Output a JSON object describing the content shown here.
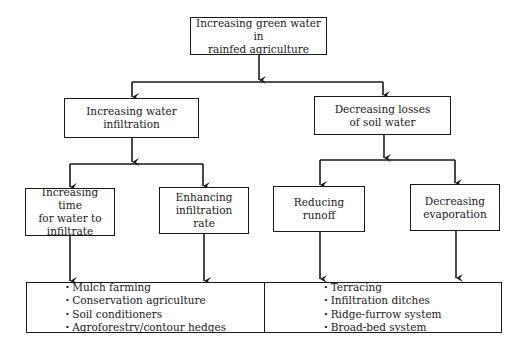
{
  "diagram": {
    "root": {
      "label_lines": [
        "Increasing green water in",
        "rainfed agriculture"
      ]
    },
    "level2": [
      {
        "label_lines": [
          "Increasing water",
          "infiltration"
        ]
      },
      {
        "label_lines": [
          "Decreasing losses",
          "of soil water"
        ]
      }
    ],
    "level3": [
      {
        "label_lines": [
          "Increasing time",
          "for water to",
          "infiltrate"
        ]
      },
      {
        "label_lines": [
          "Enhancing",
          "infiltration rate"
        ]
      },
      {
        "label_lines": [
          "Reducing runoff"
        ]
      },
      {
        "label_lines": [
          "Decreasing",
          "evaporation"
        ]
      }
    ],
    "practices": {
      "left": [
        "Mulch farming",
        "Conservation agriculture",
        "Soil conditioners",
        "Agroforestry/contour hedges"
      ],
      "right": [
        "Terracing",
        "Infiltration ditches",
        "Ridge-furrow system",
        "Broad-bed system"
      ]
    },
    "colors": {
      "line": "#1a1a1a",
      "background": "#ffffff"
    }
  }
}
